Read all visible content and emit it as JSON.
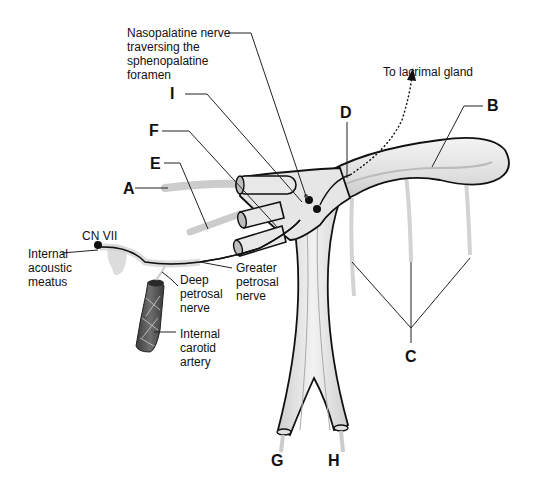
{
  "diagram": {
    "colors": {
      "structure_fill": "#e8e8e8",
      "structure_shade": "#bdbdbd",
      "outline": "#111111",
      "nerve_gray": "#c8c8c8",
      "artery_dark": "#5a5a5a",
      "leader_line": "#222222"
    },
    "letter_labels": {
      "A": "A",
      "B": "B",
      "C": "C",
      "D": "D",
      "E": "E",
      "F": "F",
      "G": "G",
      "H": "H",
      "I": "I"
    },
    "text_labels": {
      "nasopalatine": "Nasopalatine nerve\ntraversing the\nsphenopalatine\nforamen",
      "lacrimal": "To lacrimal gland",
      "cn7": "CN VII",
      "internal_acoustic": "Internal\nacoustic\nmeatus",
      "deep_petrosal": "Deep\npetrosal\nnerve",
      "greater_petrosal": "Greater\npetrosal\nnerve",
      "internal_carotid": "Internal\ncarotid\nartery"
    }
  }
}
